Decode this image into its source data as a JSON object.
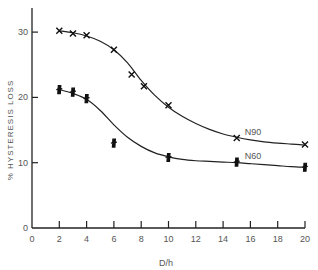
{
  "chart_data": {
    "type": "line",
    "title": "",
    "xlabel": "D/h",
    "ylabel": "% HYSTERESIS LOSS",
    "xlim": [
      0,
      20
    ],
    "ylim": [
      0,
      34
    ],
    "x_ticks": [
      0,
      2,
      4,
      6,
      8,
      10,
      12,
      14,
      16,
      18,
      20
    ],
    "y_ticks": [
      0,
      10,
      20,
      30
    ],
    "grid": false,
    "legend": "inline labels at curve ends",
    "series": [
      {
        "name": "N90",
        "marker": "x",
        "points": [
          [
            2,
            30.2
          ],
          [
            3,
            29.8
          ],
          [
            4,
            29.5
          ],
          [
            6,
            27.3
          ],
          [
            7.3,
            23.5
          ],
          [
            8.2,
            21.7
          ],
          [
            10,
            18.8
          ],
          [
            15,
            13.8
          ],
          [
            20,
            12.8
          ]
        ],
        "fit_curve": [
          [
            2,
            30.2
          ],
          [
            3,
            29.9
          ],
          [
            4,
            29.4
          ],
          [
            5,
            28.6
          ],
          [
            6,
            27.3
          ],
          [
            7,
            25.3
          ],
          [
            8,
            22.6
          ],
          [
            9,
            20.3
          ],
          [
            10,
            18.5
          ],
          [
            11,
            17.1
          ],
          [
            12,
            16.0
          ],
          [
            13,
            15.1
          ],
          [
            14,
            14.4
          ],
          [
            15,
            13.9
          ],
          [
            16,
            13.5
          ],
          [
            17,
            13.2
          ],
          [
            18,
            13.0
          ],
          [
            19,
            12.85
          ],
          [
            20,
            12.7
          ]
        ],
        "label_pos": [
          16.2,
          14.2
        ]
      },
      {
        "name": "N60",
        "marker": "filled-cross",
        "points": [
          [
            2,
            21.2
          ],
          [
            3,
            20.8
          ],
          [
            4,
            19.8
          ],
          [
            6,
            13.0
          ],
          [
            10,
            10.8
          ],
          [
            15,
            10.1
          ],
          [
            20,
            9.3
          ]
        ],
        "fit_curve": [
          [
            2,
            21.2
          ],
          [
            3,
            20.6
          ],
          [
            4,
            19.7
          ],
          [
            5,
            18.0
          ],
          [
            6,
            15.8
          ],
          [
            7,
            13.9
          ],
          [
            8,
            12.5
          ],
          [
            9,
            11.5
          ],
          [
            10,
            10.9
          ],
          [
            11,
            10.5
          ],
          [
            12,
            10.3
          ],
          [
            13,
            10.2
          ],
          [
            14,
            10.1
          ],
          [
            15,
            10.0
          ],
          [
            16,
            9.85
          ],
          [
            17,
            9.7
          ],
          [
            18,
            9.55
          ],
          [
            19,
            9.4
          ],
          [
            20,
            9.3
          ]
        ],
        "label_pos": [
          16.2,
          10.6
        ]
      }
    ]
  },
  "axes": {
    "x_label": "D/h",
    "y_label": "% HYSTERESIS LOSS"
  }
}
